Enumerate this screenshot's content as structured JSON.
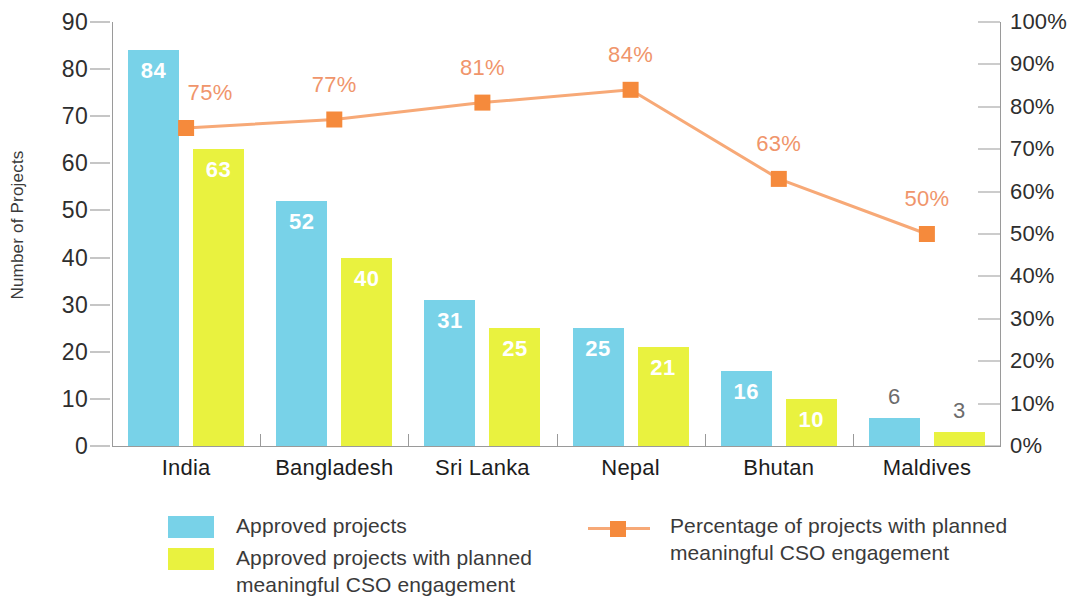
{
  "chart_data": {
    "type": "bar",
    "title": "",
    "xlabel": "",
    "ylabel": "Number of Projects",
    "y2label": "",
    "categories": [
      "India",
      "Bangladesh",
      "Sri Lanka",
      "Nepal",
      "Bhutan",
      "Maldives"
    ],
    "ylim": [
      0,
      90
    ],
    "y2lim": [
      0,
      100
    ],
    "yticks": [
      "90",
      "80",
      "70",
      "60",
      "50",
      "40",
      "30",
      "20",
      "10",
      "0"
    ],
    "y2ticks": [
      "100%",
      "90%",
      "80%",
      "70%",
      "60%",
      "50%",
      "40%",
      "30%",
      "20%",
      "10%",
      "0%"
    ],
    "grid": false,
    "legend_position": "bottom",
    "series": [
      {
        "name": "Approved projects",
        "type": "bar",
        "axis": "left",
        "color": "#78D2E8",
        "values": [
          84,
          52,
          31,
          25,
          16,
          6
        ],
        "labels": [
          "84",
          "52",
          "31",
          "25",
          "16",
          "6"
        ]
      },
      {
        "name": "Approved projects with planned meaningful CSO engagement",
        "type": "bar",
        "axis": "left",
        "color": "#E9F23F",
        "values": [
          63,
          40,
          25,
          21,
          10,
          3
        ],
        "labels": [
          "63",
          "40",
          "25",
          "21",
          "10",
          "3"
        ]
      },
      {
        "name": "Percentage of projects with planned meaningful CSO engagement",
        "type": "line",
        "axis": "right",
        "color": "#F7A977",
        "marker_color": "#F58A3C",
        "values": [
          75,
          77,
          81,
          84,
          63,
          50
        ],
        "labels": [
          "75%",
          "77%",
          "81%",
          "84%",
          "63%",
          "50%"
        ]
      }
    ]
  },
  "legend": {
    "items": [
      {
        "label": "Approved projects",
        "swatch": "#78D2E8",
        "kind": "swatch"
      },
      {
        "label": "Approved projects with planned\nmeaningful CSO engagement",
        "swatch": "#E9F23F",
        "kind": "swatch"
      },
      {
        "label": "Percentage of projects with planned\nmeaningful CSO engagement",
        "swatch": "#F58A3C",
        "kind": "line-marker"
      }
    ]
  },
  "colors": {
    "bar_blue": "#78D2E8",
    "bar_yellow": "#E9F23F",
    "line_orange": "#F7A977",
    "marker_orange": "#F58A3C",
    "pct_text": "#F0956B",
    "axis": "#9a9a9a",
    "text": "#3a3a3a"
  }
}
